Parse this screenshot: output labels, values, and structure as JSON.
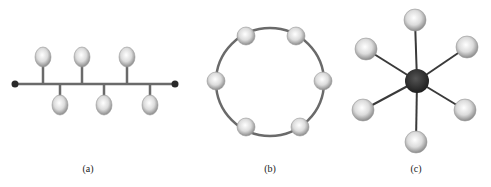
{
  "figure": {
    "panels": [
      {
        "id": "a",
        "label": "(a)",
        "topology": "bus",
        "label_pos": {
          "x": 88,
          "y": 163
        },
        "bus": {
          "x1": 15,
          "y1": 84,
          "x2": 175,
          "y2": 84
        },
        "nodes": [
          {
            "x": 43,
            "y": 57,
            "stem_to": 84
          },
          {
            "x": 82,
            "y": 57,
            "stem_to": 84
          },
          {
            "x": 127,
            "y": 57,
            "stem_to": 84
          },
          {
            "x": 60,
            "y": 105,
            "stem_to": 84
          },
          {
            "x": 104,
            "y": 105,
            "stem_to": 84
          },
          {
            "x": 150,
            "y": 105,
            "stem_to": 84
          }
        ]
      },
      {
        "id": "b",
        "label": "(b)",
        "topology": "ring",
        "label_pos": {
          "x": 270,
          "y": 163
        },
        "ring": {
          "cx": 270,
          "cy": 82,
          "r": 54
        },
        "nodes": [
          {
            "x": 246,
            "y": 36
          },
          {
            "x": 296,
            "y": 36
          },
          {
            "x": 216,
            "y": 81
          },
          {
            "x": 323,
            "y": 81
          },
          {
            "x": 246,
            "y": 127
          },
          {
            "x": 300,
            "y": 127
          }
        ]
      },
      {
        "id": "c",
        "label": "(c)",
        "topology": "star",
        "label_pos": {
          "x": 416,
          "y": 163
        },
        "hub": {
          "x": 417,
          "y": 81,
          "r": 12,
          "color": "#2a2a2a"
        },
        "nodes": [
          {
            "x": 415,
            "y": 20
          },
          {
            "x": 366,
            "y": 49
          },
          {
            "x": 467,
            "y": 47
          },
          {
            "x": 363,
            "y": 110
          },
          {
            "x": 465,
            "y": 110
          },
          {
            "x": 416,
            "y": 142
          }
        ]
      }
    ],
    "colors": {
      "line": "#6a6a6a",
      "spoke": "#3a3a3a",
      "endpoint": "#2a2a2a",
      "node_light": "#ffffff",
      "node_mid": "#d8d8d8",
      "node_dark": "#8a8a8a"
    }
  }
}
